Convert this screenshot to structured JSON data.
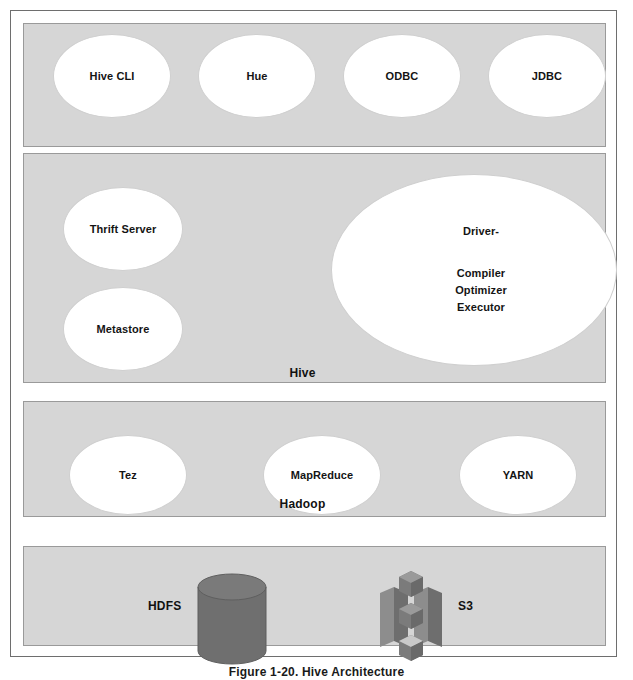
{
  "figure": {
    "caption": "Figure 1-20. Hive Architecture"
  },
  "layers": {
    "client": {
      "name": "Client layer",
      "nodes": [
        {
          "label": "Hive CLI"
        },
        {
          "label": "Hue"
        },
        {
          "label": "ODBC"
        },
        {
          "label": "JDBC"
        }
      ]
    },
    "hive": {
      "caption": "Hive",
      "nodes": [
        {
          "label": "Thrift Server"
        },
        {
          "label": "Metastore"
        }
      ],
      "driver": {
        "title": "Driver-",
        "components": [
          "Compiler",
          "Optimizer",
          "Executor"
        ]
      }
    },
    "hadoop": {
      "caption": "Hadoop",
      "nodes": [
        {
          "label": "Tez"
        },
        {
          "label": "MapReduce"
        },
        {
          "label": "YARN"
        }
      ]
    },
    "storage": {
      "items": [
        {
          "label": "HDFS",
          "icon": "cylinder-database-icon"
        },
        {
          "label": "S3",
          "icon": "s3-bucket-icon"
        }
      ]
    }
  },
  "colors": {
    "band_fill": "#d6d6d6",
    "band_border": "#9a9a9a",
    "node_fill": "#ffffff",
    "frame_border": "#6e6e6e",
    "icon_dark": "#6b6b6b",
    "icon_mid": "#7d7d7d",
    "icon_light": "#8f8f8f",
    "text": "#141414"
  }
}
